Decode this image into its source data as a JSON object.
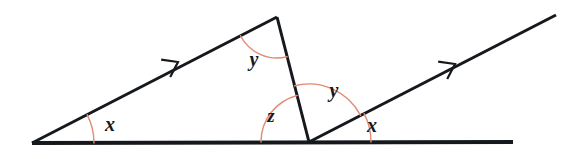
{
  "figure": {
    "canvas": {
      "width": 573,
      "height": 159
    },
    "colors": {
      "line": "#15181c",
      "arc": "#e08b74",
      "background": "#ffffff"
    },
    "stroke_widths": {
      "baseline": 4.0,
      "ray": 3.0,
      "arc": 1.4,
      "arrow": 2.2
    }
  },
  "points": {
    "left_vertex": {
      "name": "A",
      "x": 32,
      "y": 143
    },
    "apex": {
      "name": "B",
      "x": 277,
      "y": 17
    },
    "bottom_vertex": {
      "name": "C",
      "x": 309,
      "y": 142
    },
    "baseline_right_end": {
      "name": "D",
      "x": 513,
      "y": 142
    },
    "ray_upper_right_end": {
      "name": "E",
      "x": 556,
      "y": 15
    }
  },
  "segments": [
    {
      "name": "baseline",
      "from": "left_vertex",
      "to": "baseline_right_end",
      "weight": "heavy"
    },
    {
      "name": "left-transversal",
      "from": "left_vertex",
      "to": "apex",
      "weight": "normal"
    },
    {
      "name": "apex-to-bottom-vertex",
      "from": "apex",
      "to": "bottom_vertex",
      "weight": "normal"
    },
    {
      "name": "right-ray",
      "from": "bottom_vertex",
      "to": "ray_upper_right_end",
      "weight": "normal"
    }
  ],
  "arrow_markers": [
    {
      "name": "parallel-marker-left",
      "on": "left-transversal",
      "x": 178,
      "y": 62,
      "direction": "up-right"
    },
    {
      "name": "parallel-marker-right",
      "on": "right-ray",
      "x": 455,
      "y": 64,
      "direction": "up-right"
    }
  ],
  "angles": [
    {
      "name": "angle-x-left",
      "label": "x",
      "vertex": "left_vertex",
      "label_x": 110,
      "label_y": 126,
      "arc_radius": 62,
      "start_deg": 0,
      "end_deg": 27.2
    },
    {
      "name": "angle-y-apex",
      "label": "y",
      "vertex": "apex",
      "label_x": 254,
      "label_y": 61,
      "arc_radius": 41,
      "start_deg": 207.2,
      "end_deg": 284.3
    },
    {
      "name": "angle-z",
      "label": "z",
      "vertex": "bottom_vertex",
      "label_x": 271,
      "label_y": 118,
      "arc_radius": 48,
      "start_deg": 104.3,
      "end_deg": 180
    },
    {
      "name": "angle-y-bottom",
      "label": "y",
      "vertex": "bottom_vertex",
      "label_x": 334,
      "label_y": 92,
      "arc_radius": 58,
      "start_deg": 27.2,
      "end_deg": 104.3
    },
    {
      "name": "angle-x-right",
      "label": "x",
      "vertex": "bottom_vertex",
      "label_x": 372,
      "label_y": 127,
      "arc_radius": 62,
      "start_deg": 0,
      "end_deg": 27.2
    }
  ],
  "labels": {
    "x_left": "x",
    "y_apex": "y",
    "z": "z",
    "y_bottom": "y",
    "x_right": "x"
  }
}
